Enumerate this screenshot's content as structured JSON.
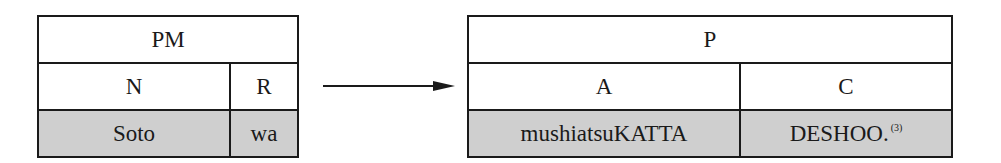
{
  "left_table": {
    "header": "PM",
    "columns": [
      "N",
      "R"
    ],
    "values": [
      "Soto",
      "wa"
    ]
  },
  "arrow": {
    "direction": "right"
  },
  "right_table": {
    "header": "P",
    "columns": [
      "A",
      "C"
    ],
    "values": [
      "mushiatsuKATTA",
      "DESHOO."
    ],
    "footnote": "(3)"
  },
  "colors": {
    "border": "#1a1a1a",
    "shade": "#cfcfcf"
  }
}
